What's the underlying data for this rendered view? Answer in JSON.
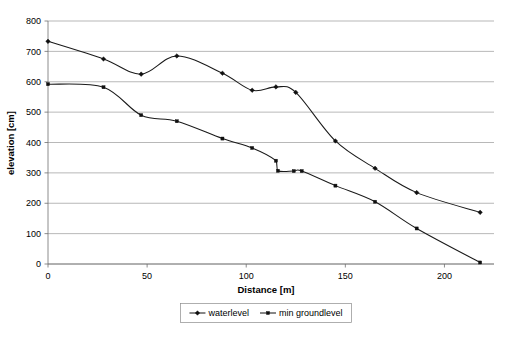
{
  "chart_data": {
    "type": "line",
    "title": "",
    "xlabel": "Distance [m]",
    "ylabel": "elevation [cm]",
    "xlim": [
      0,
      225
    ],
    "ylim": [
      0,
      800
    ],
    "xticks": [
      0,
      50,
      100,
      150,
      200
    ],
    "yticks": [
      0,
      100,
      200,
      300,
      400,
      500,
      600,
      700,
      800
    ],
    "grid": "horizontal",
    "legend_position": "bottom",
    "smoothed": true,
    "series": [
      {
        "name": "waterlevel",
        "marker": "diamond",
        "color": "#101010",
        "points": [
          {
            "x": 0,
            "y": 733
          },
          {
            "x": 28,
            "y": 675
          },
          {
            "x": 47,
            "y": 625
          },
          {
            "x": 65,
            "y": 685
          },
          {
            "x": 88,
            "y": 628
          },
          {
            "x": 103,
            "y": 572
          },
          {
            "x": 115,
            "y": 583
          },
          {
            "x": 125,
            "y": 565
          },
          {
            "x": 145,
            "y": 405
          },
          {
            "x": 165,
            "y": 315
          },
          {
            "x": 186,
            "y": 235
          },
          {
            "x": 218,
            "y": 170
          }
        ]
      },
      {
        "name": "min groundlevel",
        "marker": "square",
        "color": "#101010",
        "points": [
          {
            "x": 0,
            "y": 592
          },
          {
            "x": 28,
            "y": 582
          },
          {
            "x": 47,
            "y": 490
          },
          {
            "x": 65,
            "y": 470
          },
          {
            "x": 88,
            "y": 413
          },
          {
            "x": 103,
            "y": 382
          },
          {
            "x": 115,
            "y": 340
          },
          {
            "x": 116,
            "y": 307
          },
          {
            "x": 124,
            "y": 306
          },
          {
            "x": 128,
            "y": 306
          },
          {
            "x": 145,
            "y": 258
          },
          {
            "x": 165,
            "y": 205
          },
          {
            "x": 186,
            "y": 117
          },
          {
            "x": 218,
            "y": 5
          }
        ]
      }
    ]
  },
  "legend": {
    "entries": [
      {
        "label": "waterlevel",
        "marker": "diamond"
      },
      {
        "label": "min groundlevel",
        "marker": "square"
      }
    ]
  }
}
